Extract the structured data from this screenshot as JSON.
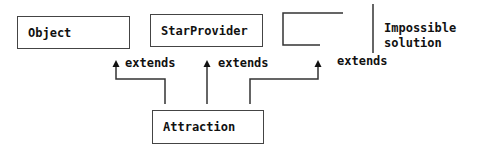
{
  "diagram": {
    "classes": {
      "object": "Object",
      "star_provider": "StarProvider",
      "attraction": "Attraction"
    },
    "relations": [
      {
        "from": "Attraction",
        "to": "Object",
        "label": "extends"
      },
      {
        "from": "Attraction",
        "to": "StarProvider",
        "label": "extends"
      },
      {
        "from": "Attraction",
        "to": "(third class)",
        "label": "extends"
      }
    ],
    "note": {
      "line1": "Impossible",
      "line2": "solution"
    }
  }
}
